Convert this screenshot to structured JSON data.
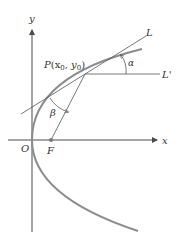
{
  "figure": {
    "labels": {
      "y_axis": "y",
      "x_axis": "x",
      "origin": "O",
      "focus": "F",
      "point": "P",
      "point_coords": "(x",
      "point_sub0": "0",
      "point_mid": ", y",
      "point_sub1": "0",
      "point_close": ")",
      "tangent_line": "L",
      "horizontal_line": "L'",
      "angle_alpha": "α",
      "angle_beta": "β"
    },
    "colors": {
      "axis": "#4a4a4a",
      "parabola": "#8c8c8c",
      "lines": "#555555",
      "text": "#333333"
    }
  }
}
